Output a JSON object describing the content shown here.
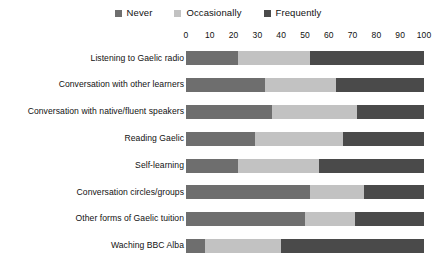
{
  "legend": {
    "position": "top-center",
    "items": [
      {
        "label": "Never",
        "color": "#6e6e6e",
        "swatch_icon": "square-swatch-icon"
      },
      {
        "label": "Occasionally",
        "color": "#c2c2c2",
        "swatch_icon": "square-swatch-icon"
      },
      {
        "label": "Frequently",
        "color": "#4a4a4a",
        "swatch_icon": "square-swatch-icon"
      }
    ]
  },
  "axis": {
    "ticks": [
      "0",
      "10",
      "20",
      "30",
      "40",
      "50",
      "60",
      "70",
      "80",
      "90",
      "100"
    ],
    "min": 0,
    "max": 100
  },
  "chart_data": {
    "type": "bar",
    "orientation": "horizontal",
    "stacked": true,
    "stack_total": 100,
    "title": "",
    "subtitle": "",
    "xlabel": "",
    "ylabel": "",
    "xlim": [
      0,
      100
    ],
    "grid": false,
    "legend_position": "top-center",
    "categories": [
      "Listening to Gaelic radio",
      "Conversation with other learners",
      "Conversation with native/fluent speakers",
      "Reading Gaelic",
      "Self-learning",
      "Conversation circles/groups",
      "Other forms of Gaelic tuition",
      "Waching BBC Alba"
    ],
    "series": [
      {
        "name": "Never",
        "color": "#6e6e6e",
        "values": [
          22,
          33,
          36,
          29,
          22,
          52,
          50,
          8
        ]
      },
      {
        "name": "Occasionally",
        "color": "#c2c2c2",
        "values": [
          30,
          30,
          36,
          37,
          34,
          23,
          21,
          32
        ]
      },
      {
        "name": "Frequently",
        "color": "#4a4a4a",
        "values": [
          48,
          37,
          28,
          34,
          44,
          25,
          29,
          60
        ]
      }
    ]
  }
}
